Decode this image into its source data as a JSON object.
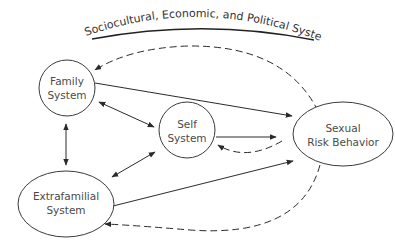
{
  "diagram": {
    "title": "Sociocultural, Economic, and Political Systems",
    "colors": {
      "stroke": "#2a2a2a",
      "text": "#4a4a4a",
      "background": "#ffffff"
    },
    "nodes": [
      {
        "id": "family",
        "shape": "circle",
        "line1": "Family",
        "line2": "System"
      },
      {
        "id": "self",
        "shape": "circle",
        "line1": "Self",
        "line2": "System"
      },
      {
        "id": "sexual",
        "shape": "ellipse",
        "line1": "Sexual",
        "line2": "Risk Behavior"
      },
      {
        "id": "extrafamilial",
        "shape": "ellipse",
        "line1": "Extrafamilial",
        "line2": "System"
      }
    ],
    "edges": [
      {
        "from": "family",
        "to": "sexual",
        "style": "solid",
        "direction": "forward"
      },
      {
        "from": "family",
        "to": "self",
        "style": "solid",
        "direction": "both"
      },
      {
        "from": "family",
        "to": "extrafamilial",
        "style": "solid",
        "direction": "both"
      },
      {
        "from": "extrafamilial",
        "to": "self",
        "style": "solid",
        "direction": "both"
      },
      {
        "from": "self",
        "to": "sexual",
        "style": "solid",
        "direction": "forward"
      },
      {
        "from": "extrafamilial",
        "to": "sexual",
        "style": "solid",
        "direction": "forward"
      },
      {
        "from": "sexual",
        "to": "self",
        "style": "dashed",
        "direction": "forward"
      },
      {
        "from": "sexual",
        "to": "family",
        "style": "dashed",
        "direction": "forward"
      },
      {
        "from": "sexual",
        "to": "extrafamilial",
        "style": "dashed",
        "direction": "forward"
      }
    ]
  }
}
